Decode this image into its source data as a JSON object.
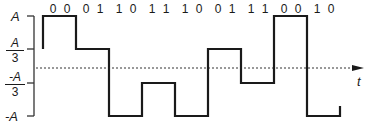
{
  "diagram": {
    "type": "4-level PAM waveform",
    "y_levels": [
      {
        "label": "A",
        "value": 1
      },
      {
        "label_num": "A",
        "label_den": "3",
        "label": "A/3",
        "value": 0.3333
      },
      {
        "label_num": "-A",
        "label_den": "3",
        "label": "-A/3",
        "value": -0.3333
      },
      {
        "label": "-A",
        "value": -1
      }
    ],
    "x_axis_label": "t",
    "symbols": [
      {
        "bits": "0 0",
        "level": 1
      },
      {
        "bits": "0 1",
        "level": 0.3333
      },
      {
        "bits": "1 0",
        "level": -1
      },
      {
        "bits": "1 1",
        "level": -0.3333
      },
      {
        "bits": "1 0",
        "level": -1
      },
      {
        "bits": "0 1",
        "level": 0.3333
      },
      {
        "bits": "1 1",
        "level": -0.3333
      },
      {
        "bits": "0 0",
        "level": 1
      },
      {
        "bits": "1 0",
        "level": -1
      }
    ],
    "colors": {
      "line": "#1a1a1a",
      "axis": "#333333",
      "background": "#ffffff"
    }
  }
}
